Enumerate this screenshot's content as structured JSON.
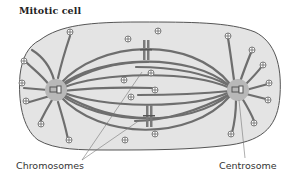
{
  "title": "Mitotic cell",
  "labels": {
    "chromosomes": "Chromosomes",
    "centrosome": "Centrosome"
  },
  "colors": {
    "cell_fill": "#e4e4e4",
    "cell_stroke": "#555555",
    "microtubule": "#6e6e6e",
    "centrosome_fill": "#b8b8b8",
    "chromosome": "#7a7a7a",
    "leader_line": "#777777"
  },
  "components": [
    "cell membrane",
    "left centrosome",
    "right centrosome",
    "spindle microtubules",
    "astral microtubules",
    "plus-end markers",
    "chromosomes"
  ],
  "plus_end_symbol": "⊕"
}
